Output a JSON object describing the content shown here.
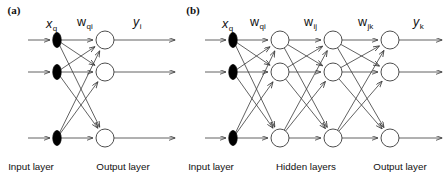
{
  "figure": {
    "background": "#ffffff",
    "stroke_color": "#3a3a3a",
    "node_fill": "#ffffff",
    "input_node_fill": "#000000",
    "width": 446,
    "height": 178
  },
  "panels": [
    {
      "tag": "(a)",
      "tag_x": 14,
      "tag_y": 14,
      "input_x": 57,
      "rows": [
        40,
        72,
        138
      ],
      "input_line_start": 28,
      "symbols": {
        "input": {
          "base": "x",
          "sub": "q",
          "x": 46,
          "y": 28
        },
        "weight1": {
          "base": "w",
          "sub": "qi",
          "x": 77,
          "y": 26
        },
        "output": {
          "base": "y",
          "sub": "i",
          "x": 133,
          "y": 26
        }
      },
      "columns": [
        {
          "name": "output-layer",
          "x": 105,
          "type": "circle",
          "label": "Output layer",
          "label_x": 123,
          "label_y": 170
        }
      ],
      "input_label": {
        "text": "Input layer",
        "x": 31,
        "y": 170
      },
      "out_arrow_end": 175
    },
    {
      "tag": "(b)",
      "tag_x": 193,
      "tag_y": 14,
      "input_x": 233,
      "rows": [
        40,
        72,
        138
      ],
      "input_line_start": 205,
      "symbols": {
        "input": {
          "base": "x",
          "sub": "q",
          "x": 222,
          "y": 28
        },
        "weight1": {
          "base": "w",
          "sub": "qi",
          "x": 250,
          "y": 26
        },
        "weight2": {
          "base": "w",
          "sub": "ij",
          "x": 304,
          "y": 26
        },
        "weight3": {
          "base": "w",
          "sub": "jk",
          "x": 358,
          "y": 26
        },
        "output": {
          "base": "y",
          "sub": "k",
          "x": 413,
          "y": 26
        }
      },
      "columns": [
        {
          "name": "hidden-layer-1",
          "x": 280,
          "type": "circle"
        },
        {
          "name": "hidden-layer-2",
          "x": 333,
          "type": "circle"
        },
        {
          "name": "output-layer",
          "x": 390,
          "type": "circle"
        }
      ],
      "input_label": {
        "text": "Input layer",
        "x": 211,
        "y": 170
      },
      "hidden_label": {
        "text": "Hidden layers",
        "x": 306,
        "y": 170
      },
      "output_label": {
        "text": "Output layer",
        "x": 400,
        "y": 170
      },
      "out_arrow_end": 442
    }
  ],
  "labels": {
    "input_layer": "Input layer",
    "hidden_layers": "Hidden layers",
    "output_layer": "Output layer"
  }
}
